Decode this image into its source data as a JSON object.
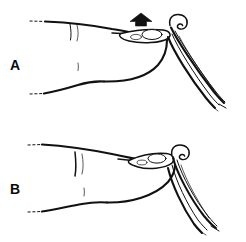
{
  "figure": {
    "kind": "line-drawing",
    "background_color": "#ffffff",
    "ink_color": "#111111",
    "width": 246,
    "height": 242
  },
  "panels": [
    {
      "id": "A",
      "label": "A",
      "label_x": 10,
      "label_y": 70,
      "caption_text": "",
      "has_arrow": true,
      "arrow": {
        "name": "up-arrow",
        "direction": "up",
        "color": "#111111",
        "x": 130,
        "y": 13,
        "width": 22,
        "height": 13
      },
      "instrument": {
        "name": "hooked-instrument",
        "orientation": "angled-down-right",
        "hook_position": "top"
      },
      "finger": {
        "posture": "extended",
        "nail_visible": true
      }
    },
    {
      "id": "B",
      "label": "B",
      "label_x": 10,
      "label_y": 194,
      "caption_text": "",
      "has_arrow": false,
      "arrow": null,
      "instrument": {
        "name": "hooked-instrument",
        "orientation": "steep-down-right",
        "hook_position": "top"
      },
      "finger": {
        "posture": "compressed",
        "nail_visible": true
      }
    }
  ],
  "colors": {
    "ink": "#111111",
    "paper": "#ffffff",
    "arrow": "#111111"
  }
}
